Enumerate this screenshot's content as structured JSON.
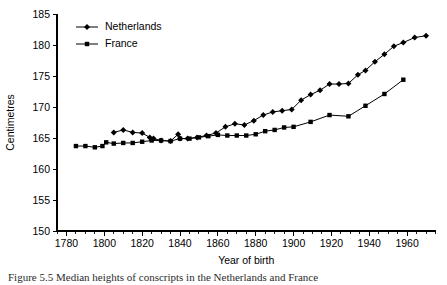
{
  "figure": {
    "caption": "Figure 5.5   Median heights of conscripts in the Netherlands and France"
  },
  "chart_data": {
    "type": "line",
    "title": "",
    "xlabel": "Year of birth",
    "ylabel": "Centimetres",
    "xlim": [
      1775,
      1975
    ],
    "ylim": [
      150,
      185
    ],
    "xticks": [
      1780,
      1800,
      1820,
      1840,
      1860,
      1880,
      1900,
      1920,
      1940,
      1960
    ],
    "xticklabels": [
      "1780",
      "1800",
      "1820",
      "1840",
      "1860",
      "1880",
      "1900",
      "1920",
      "1940",
      "1960"
    ],
    "xtick_minor_step": 5,
    "yticks": [
      150,
      155,
      160,
      165,
      170,
      175,
      180,
      185
    ],
    "yticklabels": [
      "150",
      "155",
      "160",
      "165",
      "170",
      "175",
      "180",
      "185"
    ],
    "grid": false,
    "legend_position": "top-left",
    "series": [
      {
        "name": "Netherlands",
        "marker": "diamond",
        "color": "#000000",
        "points": [
          [
            1805,
            165.9
          ],
          [
            1810,
            166.3
          ],
          [
            1815,
            165.9
          ],
          [
            1820,
            165.8
          ],
          [
            1824,
            165.1
          ],
          [
            1826,
            164.9
          ],
          [
            1830,
            164.6
          ],
          [
            1835,
            164.5
          ],
          [
            1839,
            165.6
          ],
          [
            1840,
            164.9
          ],
          [
            1844,
            164.9
          ],
          [
            1849,
            165.1
          ],
          [
            1854,
            165.4
          ],
          [
            1859,
            165.8
          ],
          [
            1864,
            166.8
          ],
          [
            1869,
            167.3
          ],
          [
            1874,
            167.1
          ],
          [
            1879,
            167.8
          ],
          [
            1884,
            168.7
          ],
          [
            1889,
            169.2
          ],
          [
            1894,
            169.4
          ],
          [
            1899,
            169.6
          ],
          [
            1904,
            171.1
          ],
          [
            1909,
            172.0
          ],
          [
            1914,
            172.7
          ],
          [
            1919,
            173.7
          ],
          [
            1924,
            173.7
          ],
          [
            1929,
            173.8
          ],
          [
            1934,
            175.2
          ],
          [
            1938,
            175.9
          ],
          [
            1943,
            177.3
          ],
          [
            1948,
            178.5
          ],
          [
            1953,
            179.8
          ],
          [
            1958,
            180.4
          ],
          [
            1964,
            181.2
          ],
          [
            1970,
            181.5
          ]
        ]
      },
      {
        "name": "France",
        "marker": "square",
        "color": "#000000",
        "points": [
          [
            1785,
            163.7
          ],
          [
            1790,
            163.7
          ],
          [
            1795,
            163.5
          ],
          [
            1799,
            163.7
          ],
          [
            1801,
            164.3
          ],
          [
            1805,
            164.1
          ],
          [
            1810,
            164.2
          ],
          [
            1815,
            164.2
          ],
          [
            1820,
            164.4
          ],
          [
            1825,
            164.6
          ],
          [
            1830,
            164.6
          ],
          [
            1835,
            164.5
          ],
          [
            1840,
            164.9
          ],
          [
            1845,
            164.9
          ],
          [
            1850,
            165.1
          ],
          [
            1855,
            165.3
          ],
          [
            1860,
            165.5
          ],
          [
            1865,
            165.4
          ],
          [
            1870,
            165.4
          ],
          [
            1875,
            165.4
          ],
          [
            1880,
            165.6
          ],
          [
            1885,
            166.1
          ],
          [
            1890,
            166.3
          ],
          [
            1895,
            166.7
          ],
          [
            1900,
            166.8
          ],
          [
            1909,
            167.6
          ],
          [
            1919,
            168.7
          ],
          [
            1929,
            168.5
          ],
          [
            1938,
            170.2
          ],
          [
            1948,
            172.1
          ],
          [
            1958,
            174.4
          ]
        ]
      }
    ],
    "legend": [
      {
        "label": "Netherlands",
        "marker": "diamond"
      },
      {
        "label": "France",
        "marker": "square"
      }
    ]
  }
}
